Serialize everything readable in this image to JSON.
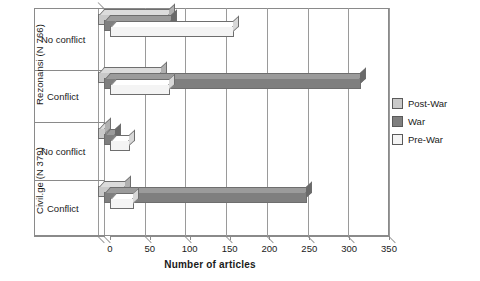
{
  "chart_data": {
    "type": "bar",
    "orientation": "horizontal",
    "title": "",
    "xlabel": "Number of articles",
    "ylabel": "",
    "xlim": [
      0,
      350
    ],
    "xticks": [
      0,
      50,
      100,
      150,
      200,
      250,
      300,
      350
    ],
    "grid": true,
    "legend_position": "right",
    "groups": [
      {
        "name": "Rezonansi (N 766)",
        "categories": [
          "No conflict",
          "Conflict"
        ]
      },
      {
        "name": "Civil.ge (N 379)",
        "categories": [
          "No conflict",
          "Conflict"
        ]
      }
    ],
    "categories": [
      "Rezonansi (N 766) / No conflict",
      "Rezonansi (N 766) / Conflict",
      "Civil.ge (N 379) / No conflict",
      "Civil.ge (N 379) / Conflict"
    ],
    "series": [
      {
        "name": "Post-War",
        "color": "#c9c9c9",
        "values": [
          90,
          80,
          10,
          35
        ]
      },
      {
        "name": "War",
        "color": "#7f7f7f",
        "values": [
          85,
          322,
          15,
          255
        ]
      },
      {
        "name": "Pre-War",
        "color": "#f4f4f4",
        "values": [
          155,
          75,
          25,
          30
        ]
      }
    ]
  },
  "axis": {
    "xlabel": "Number of articles",
    "ticks": [
      "0",
      "50",
      "100",
      "150",
      "200",
      "250",
      "300",
      "350"
    ]
  },
  "legend": {
    "items": [
      {
        "label": "Post-War",
        "color": "#c9c9c9"
      },
      {
        "label": "War",
        "color": "#7f7f7f"
      },
      {
        "label": "Pre-War",
        "color": "#f4f4f4"
      }
    ]
  },
  "groups": {
    "rezonansi": {
      "label": "Rezonansi (N 766)",
      "cat_top": "No conflict",
      "cat_bottom": "Conflict"
    },
    "civilge": {
      "label": "Civil.ge (N 379)",
      "cat_top": "No conflict",
      "cat_bottom": "Conflict"
    }
  }
}
